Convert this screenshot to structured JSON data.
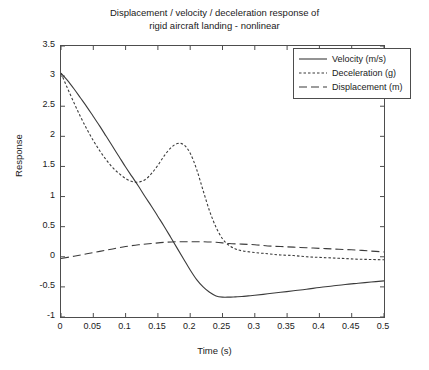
{
  "chart_data": {
    "type": "line",
    "title": "Displacement / velocity / deceleration response of\nrigid aircraft landing - nonlinear",
    "title_line1": "Displacement / velocity / deceleration response of",
    "title_line2": "rigid aircraft landing - nonlinear",
    "xlabel": "Time (s)",
    "ylabel": "Response",
    "xlim": [
      0,
      0.5
    ],
    "ylim": [
      -1,
      3.5
    ],
    "xticks": [
      0,
      0.05,
      0.1,
      0.15,
      0.2,
      0.25,
      0.3,
      0.35,
      0.4,
      0.45,
      0.5
    ],
    "xticklabels": [
      "0",
      "0.05",
      "0.1",
      "0.15",
      "0.2",
      "0.25",
      "0.3",
      "0.35",
      "0.4",
      "0.45",
      "0.5"
    ],
    "yticks": [
      -1,
      -0.5,
      0,
      0.5,
      1,
      1.5,
      2,
      2.5,
      3,
      3.5
    ],
    "yticklabels": [
      "-1",
      "-0.5",
      "0",
      "0.5",
      "1",
      "1.5",
      "2",
      "2.5",
      "3",
      "3.5"
    ],
    "grid": false,
    "legend_position": "upper right",
    "series": [
      {
        "name": "Velocity (m/s)",
        "style": "solid",
        "color": "#3b3b3b",
        "x": [
          0,
          0.01,
          0.02,
          0.03,
          0.04,
          0.05,
          0.06,
          0.07,
          0.08,
          0.09,
          0.1,
          0.11,
          0.12,
          0.13,
          0.14,
          0.15,
          0.16,
          0.17,
          0.18,
          0.19,
          0.2,
          0.21,
          0.22,
          0.23,
          0.24,
          0.25,
          0.26,
          0.27,
          0.28,
          0.29,
          0.3,
          0.32,
          0.34,
          0.36,
          0.38,
          0.4,
          0.42,
          0.44,
          0.46,
          0.48,
          0.5
        ],
        "values": [
          3.05,
          2.93,
          2.79,
          2.64,
          2.49,
          2.33,
          2.17,
          2.0,
          1.83,
          1.66,
          1.49,
          1.33,
          1.17,
          1.0,
          0.84,
          0.67,
          0.5,
          0.32,
          0.14,
          -0.04,
          -0.22,
          -0.38,
          -0.5,
          -0.59,
          -0.65,
          -0.67,
          -0.67,
          -0.665,
          -0.66,
          -0.65,
          -0.64,
          -0.615,
          -0.59,
          -0.565,
          -0.54,
          -0.51,
          -0.485,
          -0.46,
          -0.44,
          -0.42,
          -0.4
        ]
      },
      {
        "name": "Deceleration (g)",
        "style": "dotted",
        "color": "#3b3b3b",
        "x": [
          0,
          0.01,
          0.02,
          0.03,
          0.04,
          0.05,
          0.06,
          0.07,
          0.08,
          0.09,
          0.1,
          0.11,
          0.12,
          0.13,
          0.14,
          0.15,
          0.16,
          0.17,
          0.18,
          0.19,
          0.2,
          0.21,
          0.22,
          0.23,
          0.24,
          0.25,
          0.26,
          0.27,
          0.28,
          0.3,
          0.32,
          0.34,
          0.36,
          0.38,
          0.4,
          0.42,
          0.44,
          0.46,
          0.48,
          0.5
        ],
        "values": [
          3.05,
          2.8,
          2.56,
          2.33,
          2.12,
          1.93,
          1.76,
          1.61,
          1.48,
          1.38,
          1.3,
          1.25,
          1.24,
          1.28,
          1.38,
          1.52,
          1.68,
          1.81,
          1.88,
          1.86,
          1.72,
          1.45,
          1.1,
          0.76,
          0.49,
          0.3,
          0.19,
          0.13,
          0.1,
          0.07,
          0.05,
          0.03,
          0.02,
          0.0,
          -0.01,
          -0.02,
          -0.03,
          -0.04,
          -0.045,
          -0.05
        ]
      },
      {
        "name": "Displacement (m)",
        "style": "dashed",
        "color": "#3b3b3b",
        "x": [
          0,
          0.02,
          0.04,
          0.06,
          0.08,
          0.1,
          0.12,
          0.14,
          0.16,
          0.18,
          0.2,
          0.22,
          0.24,
          0.26,
          0.28,
          0.3,
          0.32,
          0.34,
          0.36,
          0.38,
          0.4,
          0.42,
          0.44,
          0.46,
          0.48,
          0.5
        ],
        "values": [
          -0.03,
          0.01,
          0.05,
          0.09,
          0.13,
          0.17,
          0.2,
          0.22,
          0.24,
          0.25,
          0.25,
          0.25,
          0.24,
          0.22,
          0.21,
          0.2,
          0.18,
          0.17,
          0.16,
          0.15,
          0.14,
          0.13,
          0.12,
          0.11,
          0.095,
          0.08
        ]
      }
    ]
  }
}
